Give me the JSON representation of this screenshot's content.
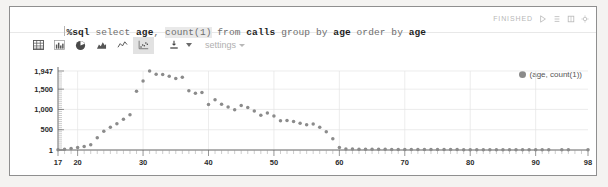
{
  "query": {
    "prefix": "%sql",
    "full_text": "%sql select age, count(1) from calls group by age order by age",
    "tokens": [
      {
        "t": "%sql",
        "k": "pct"
      },
      {
        "t": " select ",
        "k": "kw"
      },
      {
        "t": "age",
        "k": "id"
      },
      {
        "t": ", ",
        "k": "kw"
      },
      {
        "t": "count(1)",
        "k": "fn"
      },
      {
        "t": " from ",
        "k": "kw"
      },
      {
        "t": "calls",
        "k": "tbl"
      },
      {
        "t": " group by ",
        "k": "kw"
      },
      {
        "t": "age",
        "k": "id"
      },
      {
        "t": " order by ",
        "k": "kw"
      },
      {
        "t": "age",
        "k": "id"
      }
    ]
  },
  "status": {
    "label": "FINISHED",
    "icons": [
      "play-icon",
      "list-icon",
      "book-icon",
      "gear-icon"
    ]
  },
  "toolbar": {
    "chart_buttons": [
      {
        "name": "table-view-icon",
        "label": "Table",
        "active": false
      },
      {
        "name": "bar-chart-icon",
        "label": "Bar Chart",
        "active": false
      },
      {
        "name": "pie-chart-icon",
        "label": "Pie Chart",
        "active": false
      },
      {
        "name": "area-chart-icon",
        "label": "Area Chart",
        "active": false
      },
      {
        "name": "line-chart-icon",
        "label": "Line Chart",
        "active": false
      },
      {
        "name": "scatter-chart-icon",
        "label": "Scatter Chart",
        "active": true
      }
    ],
    "download_label": "Download",
    "settings_label": "settings"
  },
  "chart_data": {
    "type": "scatter",
    "title": "",
    "xlabel": "",
    "ylabel": "",
    "xlim": [
      17,
      98
    ],
    "ylim": [
      1,
      1947
    ],
    "grid": true,
    "legend_position": "top-right",
    "legend": [
      "(age, count(1))"
    ],
    "series_name": "(age, count(1))",
    "xticks": [
      17,
      20,
      30,
      40,
      50,
      60,
      70,
      80,
      90,
      98
    ],
    "yticks": [
      1,
      500,
      1000,
      1500,
      1947
    ],
    "ytick_labels": [
      "1",
      "500",
      "1,000",
      "1,500",
      "1,947"
    ],
    "x": [
      17,
      18,
      19,
      20,
      21,
      22,
      23,
      24,
      25,
      26,
      27,
      28,
      29,
      30,
      31,
      32,
      33,
      34,
      35,
      36,
      37,
      38,
      39,
      40,
      41,
      42,
      43,
      44,
      45,
      46,
      47,
      48,
      49,
      50,
      51,
      52,
      53,
      54,
      55,
      56,
      57,
      58,
      59,
      60,
      61,
      62,
      63,
      64,
      65,
      66,
      67,
      68,
      69,
      70,
      71,
      72,
      73,
      74,
      75,
      76,
      77,
      78,
      79,
      80,
      81,
      82,
      83,
      84,
      85,
      86,
      87,
      88,
      89,
      90,
      91,
      92,
      94,
      95,
      98
    ],
    "y": [
      8,
      20,
      35,
      60,
      90,
      130,
      300,
      460,
      560,
      650,
      760,
      870,
      1450,
      1700,
      1947,
      1870,
      1860,
      1820,
      1760,
      1790,
      1460,
      1400,
      1420,
      1120,
      1240,
      1130,
      1060,
      990,
      1100,
      1050,
      960,
      860,
      910,
      840,
      720,
      730,
      700,
      660,
      620,
      640,
      560,
      450,
      280,
      60,
      26,
      24,
      22,
      20,
      20,
      18,
      17,
      16,
      16,
      15,
      14,
      14,
      13,
      13,
      12,
      12,
      11,
      11,
      10,
      10,
      10,
      9,
      9,
      8,
      8,
      8,
      7,
      7,
      7,
      6,
      6,
      6,
      5,
      5,
      5
    ]
  }
}
